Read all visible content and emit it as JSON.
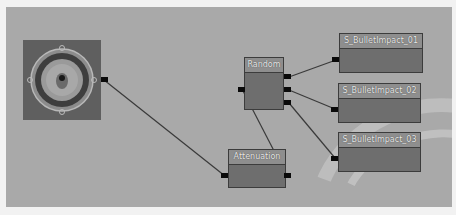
{
  "editor": {
    "type": "sound-cue-node-graph"
  },
  "nodes": {
    "output": {
      "icon": "speaker-icon",
      "label": ""
    },
    "attenuation": {
      "title": "Attenuation"
    },
    "random": {
      "title": "Random"
    },
    "wave1": {
      "title": "S_BulletImpact_01"
    },
    "wave2": {
      "title": "S_BulletImpact_02"
    },
    "wave3": {
      "title": "S_BulletImpact_03"
    }
  },
  "connections": [
    {
      "from": "output",
      "to": "attenuation.output"
    },
    {
      "from": "attenuation.input",
      "to": "random.input"
    },
    {
      "from": "random.output_1",
      "to": "wave1.input"
    },
    {
      "from": "random.output_2",
      "to": "wave2.input"
    },
    {
      "from": "random.output_3",
      "to": "wave3.input"
    }
  ],
  "colors": {
    "canvas": "#a9a9a9",
    "node_body": "#6e6e6e",
    "node_header": "#8e8e8e",
    "pin": "#0a0a0a",
    "wire": "#3a3a3a"
  }
}
